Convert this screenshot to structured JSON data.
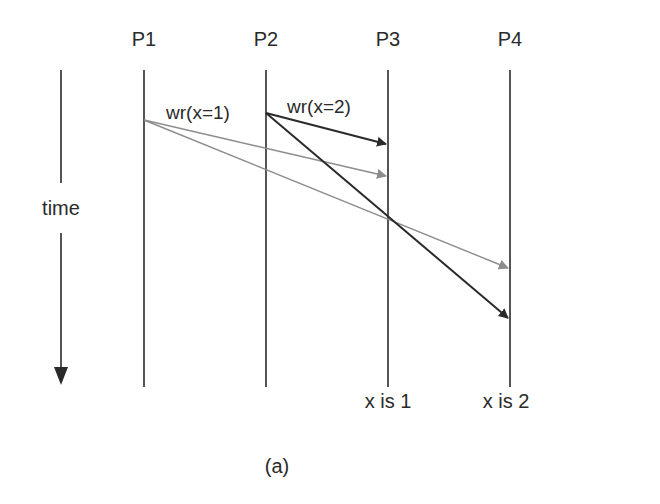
{
  "diagram": {
    "processes": [
      {
        "id": "P1",
        "label": "P1",
        "x": 144
      },
      {
        "id": "P2",
        "label": "P2",
        "x": 266
      },
      {
        "id": "P3",
        "label": "P3",
        "x": 388
      },
      {
        "id": "P4",
        "label": "P4",
        "x": 510
      }
    ],
    "time_axis": {
      "label": "time"
    },
    "messages": [
      {
        "label": "wr(x=1)",
        "from": "P1",
        "color": "#8c8c8c"
      },
      {
        "label": "wr(x=2)",
        "from": "P2",
        "color": "#2a2a2a"
      }
    ],
    "results": [
      {
        "process": "P3",
        "label": "x is 1"
      },
      {
        "process": "P4",
        "label": "x is 2"
      }
    ],
    "caption": "(a)",
    "colors": {
      "dark": "#2a2a2a",
      "gray": "#8c8c8c"
    }
  }
}
